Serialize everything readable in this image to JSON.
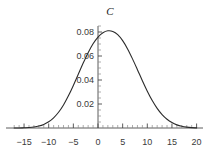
{
  "chart_data": {
    "type": "line",
    "title": "C",
    "xlabel": "",
    "ylabel": "",
    "xlim": [
      -17.5,
      20.5
    ],
    "ylim": [
      0,
      0.095
    ],
    "grid": false,
    "legend": null,
    "xticks": [
      -15,
      -10,
      -5,
      0,
      5,
      10,
      15,
      20
    ],
    "xtick_labels": [
      "-15",
      "-10",
      "-5",
      "0",
      "5",
      "10",
      "15",
      "20"
    ],
    "yticks": [
      0.02,
      0.04,
      0.06,
      0.08
    ],
    "ytick_labels": [
      "0.02",
      "0.04",
      "0.06",
      "0.08"
    ],
    "x_minor_tick_step": 1,
    "y_minor_tick_step": 0.005,
    "peak": {
      "x": 2.0,
      "y": 0.081
    },
    "series": [
      {
        "name": "C",
        "color": "#2b2b2b",
        "x": [
          -17,
          -16,
          -15,
          -14,
          -13,
          -12,
          -11,
          -10,
          -9,
          -8,
          -7,
          -6,
          -5,
          -4,
          -3,
          -2,
          -1,
          0,
          1,
          2,
          3,
          4,
          5,
          6,
          7,
          8,
          9,
          10,
          11,
          12,
          13,
          14,
          15,
          16,
          17,
          18,
          19,
          20
        ],
        "values": [
          0.0,
          0.0,
          0.0002,
          0.0004,
          0.0008,
          0.0016,
          0.003,
          0.0052,
          0.0085,
          0.0131,
          0.0192,
          0.0268,
          0.0355,
          0.0448,
          0.0541,
          0.0628,
          0.0702,
          0.0758,
          0.0794,
          0.081,
          0.0805,
          0.0778,
          0.0728,
          0.0659,
          0.0576,
          0.0486,
          0.0394,
          0.0307,
          0.0229,
          0.0164,
          0.0112,
          0.0073,
          0.0045,
          0.0026,
          0.0014,
          0.0007,
          0.0003,
          0.0001
        ]
      }
    ]
  }
}
